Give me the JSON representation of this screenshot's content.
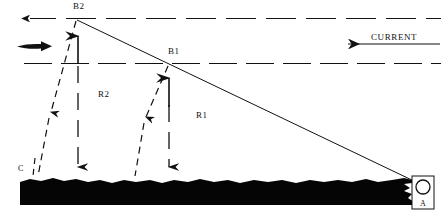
{
  "figure": {
    "type": "technical-diagram",
    "background_color": "#ffffff",
    "ink_color": "#111111",
    "seabed_color": "#050505"
  },
  "labels": {
    "b2": "B2",
    "b1": "B1",
    "r2": "R2",
    "r1": "R1",
    "c": "C",
    "a": "A",
    "current": "CURRENT"
  },
  "elements": {
    "top_layer_line": "horizontal dashed line, upper water layer boundary",
    "mid_layer_line": "horizontal dashed line, middle water layer boundary",
    "direct_path": "solid straight line from B2 down to A",
    "current_arrow": "solid arrow pointing left labelled CURRENT",
    "flow_arrow": "thick solid arrow pointing right at upper left",
    "seabed": "irregular solid black seabed mass",
    "source_marker": "open circle marker at A",
    "up_arrows": [
      "dashed vertical arrow up to B2",
      "dashed vertical arrow up to B1"
    ],
    "down_arrows": [
      "dashed vertical arrow down to seabed at B2 column",
      "dashed vertical arrow down to seabed at B1 column"
    ],
    "slant_arrows": [
      "dashed slanted arrow from B2 down-left to C",
      "dashed slanted arrow from B1 down-left"
    ]
  }
}
